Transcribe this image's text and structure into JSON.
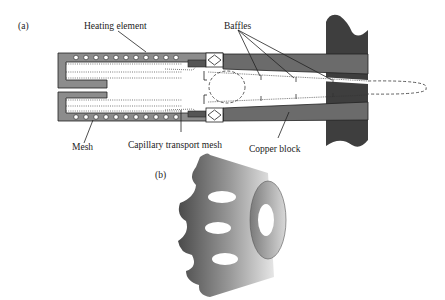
{
  "figure": {
    "panel_a": {
      "label": "(a)",
      "callouts": {
        "heating_element": "Heating element",
        "baffles": "Baffles",
        "mesh": "Mesh",
        "capillary_transport_mesh": "Capillary transport mesh",
        "copper_block": "Copper block"
      }
    },
    "panel_b": {
      "label": "(b)"
    },
    "colors": {
      "copper_block": "#6b6b6b",
      "wall_dark": "#3e3e3e",
      "housing": "#8c8c8c",
      "heater_dots": "#ffffff",
      "line": "#1a1a1a"
    }
  }
}
